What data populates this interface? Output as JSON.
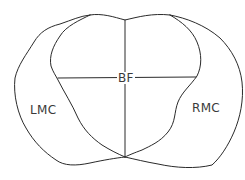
{
  "diagram": {
    "type": "anatomical cross-section outline",
    "regions": {
      "center": {
        "label": "BF"
      },
      "left": {
        "label": "LMC"
      },
      "right": {
        "label": "RMC"
      }
    },
    "colors": {
      "stroke": "#2a2a2a",
      "text": "#3a3a3a",
      "background": "#ffffff"
    }
  }
}
